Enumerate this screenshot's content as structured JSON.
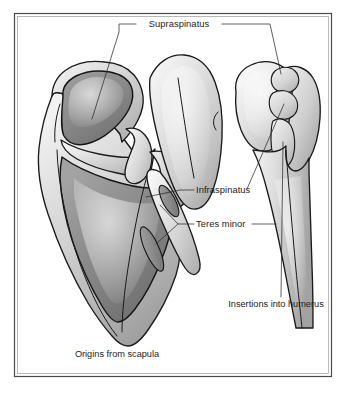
{
  "figure": {
    "kind": "anatomical-illustration",
    "view": "posterior",
    "background_color": "#ffffff",
    "frame": {
      "present": true,
      "border_color": "#4a4a4a",
      "inner_border_color": "#9a9a9a",
      "x": 14,
      "y": 13,
      "width": 318,
      "height": 364
    },
    "palette": {
      "outline": "#1a1a1a",
      "bone_light": "#f0f0f0",
      "bone_mid": "#cfcfcf",
      "bone_shadow": "#a8a8a8",
      "fossa_dark": "#8d8d8d",
      "fossa_darker": "#7a7a7a",
      "leader_line": "#2b2b2b",
      "text": "#1d1d1d"
    }
  },
  "labels": [
    {
      "id": "supraspinatus",
      "text": "Supraspinatus",
      "x": 179,
      "y": 27,
      "anchor": "middle",
      "describes": "supraspinous fossa origin and superior facet insertion"
    },
    {
      "id": "infraspinatus",
      "text": "Infraspinatus",
      "x": 196,
      "y": 193,
      "anchor": "start",
      "describes": "infraspinous fossa origin and middle facet insertion"
    },
    {
      "id": "teres-minor",
      "text": "Teres minor",
      "x": 196,
      "y": 227,
      "anchor": "start",
      "describes": "lateral border origin and inferior facet insertion"
    },
    {
      "id": "insertions-into-humerus",
      "text": "Insertions into humerus",
      "x": 276,
      "y": 307,
      "anchor": "middle",
      "describes": "greater tuberosity facets on the humerus"
    },
    {
      "id": "origins-from-scapula",
      "text": "Origins from scapula",
      "x": 117,
      "y": 357,
      "anchor": "middle",
      "describes": "shaded muscle origin areas on the scapula"
    }
  ],
  "structures": {
    "scapula": {
      "name": "scapula",
      "side": "left",
      "regions": [
        {
          "id": "supraspinous-fossa",
          "name": "Supraspinous fossa",
          "shaded": true
        },
        {
          "id": "infraspinous-fossa",
          "name": "Infraspinous fossa",
          "shaded": true
        },
        {
          "id": "teres-minor-origin-upper",
          "name": "Lateral border origin (upper)",
          "shaded": true
        },
        {
          "id": "teres-minor-origin-lower",
          "name": "Lateral border origin (lower)",
          "shaded": true
        },
        {
          "id": "spine-of-scapula",
          "name": "Spine of scapula",
          "shaded": false
        },
        {
          "id": "acromion",
          "name": "Acromion",
          "shaded": false
        },
        {
          "id": "glenoid",
          "name": "Glenoid region",
          "shaded": false
        }
      ]
    },
    "humerus": {
      "name": "humerus",
      "side": "right",
      "regions": [
        {
          "id": "humeral-head",
          "name": "Head of humerus",
          "shaded": false
        },
        {
          "id": "facet-superior",
          "name": "Superior facet (supraspinatus insertion)",
          "shaded": false
        },
        {
          "id": "facet-middle",
          "name": "Middle facet (infraspinatus insertion)",
          "shaded": false
        },
        {
          "id": "facet-inferior",
          "name": "Inferior facet (teres minor insertion)",
          "shaded": false
        },
        {
          "id": "humeral-shaft",
          "name": "Shaft of humerus",
          "shaded": false
        }
      ]
    }
  }
}
